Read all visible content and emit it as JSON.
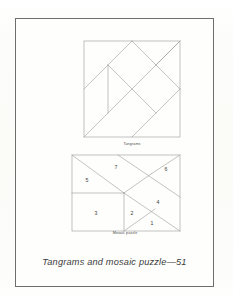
{
  "page": {
    "background_color": "#fdfdfb",
    "border_color": "#6e6e6e",
    "line_color": "#9a9a9a",
    "text_color": "#3b3b3b"
  },
  "figures": {
    "tangram": {
      "caption": "Tangrams",
      "shape": "square",
      "description": "Square dissected into seven tangram pieces"
    },
    "mosaic": {
      "caption": "Mosaic puzzle",
      "shape": "rectangle",
      "piece_labels": [
        "1",
        "2",
        "3",
        "4",
        "5",
        "6",
        "7"
      ]
    }
  },
  "caption": {
    "text": "Tangrams and mosaic puzzle—51"
  }
}
